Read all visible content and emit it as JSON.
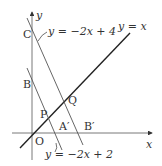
{
  "axes": {
    "x_label": "x",
    "y_label": "y",
    "origin_label": "O"
  },
  "lines": [
    {
      "id": "line-y-eq-x",
      "label": "y = x"
    },
    {
      "id": "line-c",
      "label": "y = −2x + 4"
    },
    {
      "id": "line-b",
      "label": "y = −2x + 2"
    }
  ],
  "points": {
    "C": "C",
    "B": "B",
    "P": "P",
    "Q": "Q",
    "A_prime": "A′",
    "B_prime": "B′"
  },
  "colors": {
    "stroke": "#333333",
    "thin": "#555555"
  }
}
